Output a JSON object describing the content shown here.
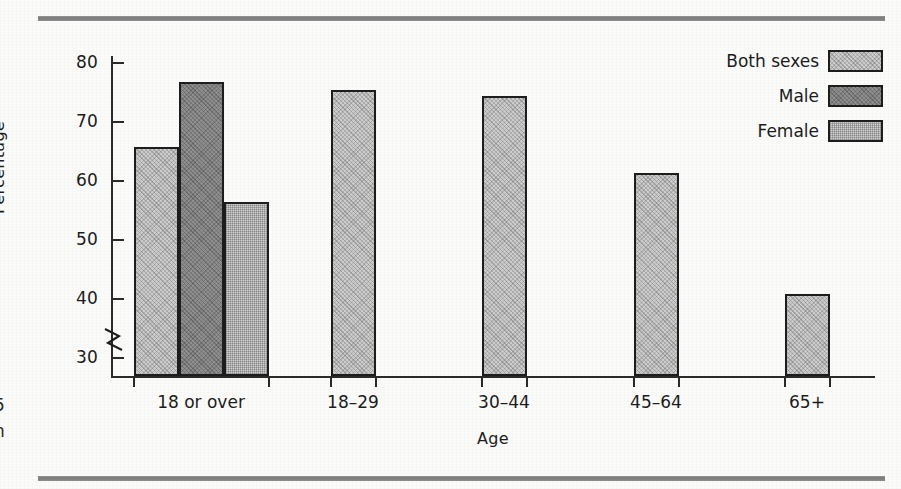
{
  "figure": {
    "rules": {
      "top_label": "top-rule",
      "bottom_label": "bottom-rule"
    },
    "edge_caption_fragment": "5\nn"
  },
  "chart_data": {
    "type": "bar",
    "title": "",
    "xlabel": "Age",
    "ylabel": "Percentage",
    "categories": [
      "18 or over",
      "18–29",
      "30–44",
      "45–64",
      "65+"
    ],
    "yticks": [
      30,
      40,
      50,
      60,
      70,
      80
    ],
    "ylim": [
      27,
      80
    ],
    "axis_break": true,
    "axis_break_note": "zigzag break on y-axis below 30",
    "grid": false,
    "legend_position": "top-right",
    "series": [
      {
        "name": "Both sexes",
        "color": "#cccccc",
        "values": [
          65.8,
          75.4,
          74.3,
          61.4,
          40.8
        ]
      },
      {
        "name": "Male",
        "color": "#8f8f8f",
        "values": [
          76.7,
          null,
          null,
          null,
          null
        ]
      },
      {
        "name": "Female",
        "color": "#d2d2d2",
        "values": [
          56.5,
          null,
          null,
          null,
          null
        ]
      }
    ],
    "bars": [
      {
        "group": "18 or over",
        "series": "Both sexes",
        "value": 65.8
      },
      {
        "group": "18 or over",
        "series": "Male",
        "value": 76.7
      },
      {
        "group": "18 or over",
        "series": "Female",
        "value": 56.5
      },
      {
        "group": "18–29",
        "series": "Both sexes",
        "value": 75.4
      },
      {
        "group": "30–44",
        "series": "Both sexes",
        "value": 74.3
      },
      {
        "group": "45–64",
        "series": "Both sexes",
        "value": 61.4
      },
      {
        "group": "65+",
        "series": "Both sexes",
        "value": 40.8
      }
    ]
  },
  "legend": {
    "items": [
      {
        "label": "Both sexes",
        "swatch": "both-sexes-swatch"
      },
      {
        "label": "Male",
        "swatch": "male-swatch"
      },
      {
        "label": "Female",
        "swatch": "female-swatch"
      }
    ]
  },
  "axis": {
    "y_tick_labels": [
      "80",
      "70",
      "60",
      "50",
      "40",
      "30"
    ],
    "y_title": "Percentage",
    "x_title": "Age",
    "x_tick_labels": [
      "18 or over",
      "18–29",
      "30–44",
      "45–64",
      "65+"
    ]
  }
}
